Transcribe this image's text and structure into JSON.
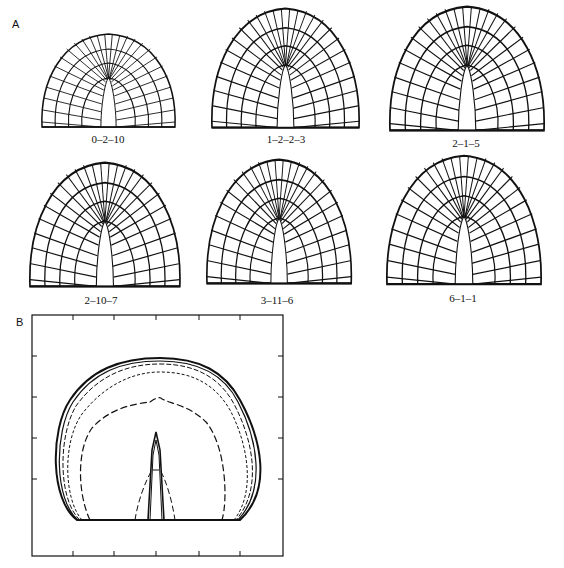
{
  "figure": {
    "panel_a": {
      "letter": "A",
      "meshes": [
        {
          "id": "0-2-10",
          "label": "0–2–10"
        },
        {
          "id": "1-2-2-3",
          "label": "1–2–2–3"
        },
        {
          "id": "2-1-5",
          "label": "2–1–5"
        },
        {
          "id": "2-10-7",
          "label": "2–10–7"
        },
        {
          "id": "3-11-6",
          "label": "3–11–6"
        },
        {
          "id": "6-1-1",
          "label": "6–1–1"
        }
      ]
    },
    "panel_b": {
      "letter": "B",
      "overlay_curves": [
        "0-2-10",
        "1-2-2-3",
        "2-1-5",
        "2-10-7",
        "3-11-6",
        "6-1-1"
      ],
      "x_ticks": 5,
      "y_ticks": 4
    }
  }
}
